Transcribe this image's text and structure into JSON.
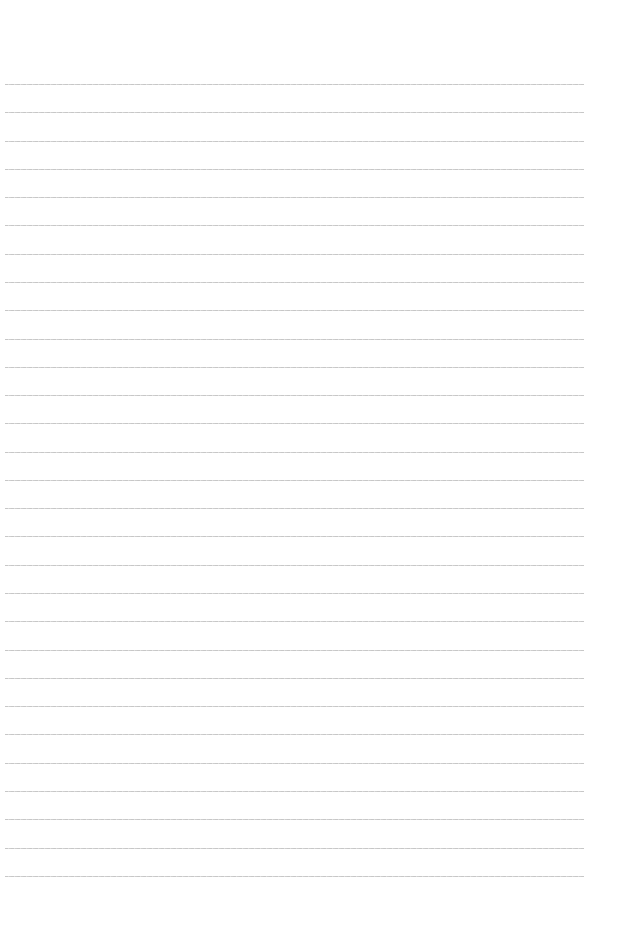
{
  "page": {
    "type": "lined-paper",
    "background_color": "#ffffff",
    "line_color": "#c4c4c4",
    "line_count": 29,
    "first_line_y": 84,
    "line_spacing": 28.28,
    "line_left": 5,
    "line_right": 584
  }
}
